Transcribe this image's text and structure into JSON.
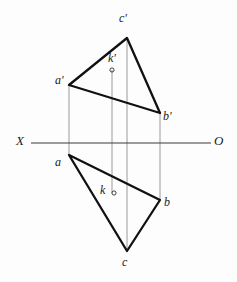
{
  "figure": {
    "type": "descriptive-geometry-projection",
    "background_color": "#fdfdfd",
    "line_color": "#111111",
    "projector_color": "#8e8e8e",
    "axis_color": "#3a3a3a"
  },
  "axis": {
    "left_label": "X",
    "right_label": "O",
    "y": 143,
    "x_start": 31,
    "x_end": 211,
    "left_label_x": 16,
    "left_label_y": 134,
    "right_label_x": 214,
    "right_label_y": 134
  },
  "points": {
    "a_prime": {
      "label": "a'",
      "x": 69,
      "y": 85,
      "label_x": 55,
      "label_y": 74
    },
    "b_prime": {
      "label": "b'",
      "x": 160,
      "y": 113,
      "label_x": 163,
      "label_y": 110
    },
    "c_prime": {
      "label": "c'",
      "x": 127,
      "y": 38,
      "label_x": 119,
      "label_y": 12
    },
    "k_prime": {
      "label": "k'",
      "x": 112,
      "y": 70,
      "label_x": 108,
      "label_y": 52
    },
    "a": {
      "label": "a",
      "x": 69,
      "y": 155,
      "label_x": 55,
      "label_y": 156
    },
    "b": {
      "label": "b",
      "x": 160,
      "y": 200,
      "label_x": 164,
      "label_y": 196
    },
    "c": {
      "label": "c",
      "x": 127,
      "y": 251,
      "label_x": 122,
      "label_y": 256
    },
    "k": {
      "label": "k",
      "x": 114,
      "y": 193,
      "label_x": 100,
      "label_y": 184
    }
  },
  "shapes": {
    "frontal_triangle": {
      "name": "frontal-projection-triangle",
      "path": "M 69 85 L 127 38 L 160 113 Z"
    },
    "horizontal_triangle": {
      "name": "horizontal-projection-triangle",
      "path": "M 69 155 L 160 200 L 127 251 Z"
    }
  },
  "projectors": [
    {
      "name": "projector-a",
      "x1": 69,
      "y1": 85,
      "x2": 69,
      "y2": 155
    },
    {
      "name": "projector-b",
      "x1": 160,
      "y1": 113,
      "x2": 160,
      "y2": 200
    },
    {
      "name": "projector-c",
      "x1": 127,
      "y1": 38,
      "x2": 127,
      "y2": 251
    },
    {
      "name": "projector-k",
      "x1": 112,
      "y1": 70,
      "x2": 112,
      "y2": 193
    }
  ],
  "markers": {
    "k_prime_radius": 2.1,
    "k_radius": 2.1
  }
}
